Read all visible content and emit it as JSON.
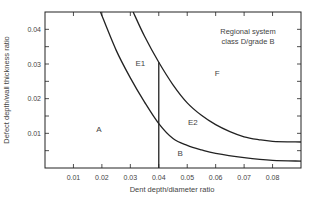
{
  "chart_data": {
    "type": "line",
    "title_lines": [
      "Regional system",
      "class D/grade B"
    ],
    "xlabel": "Dent depth/diameter ratio",
    "ylabel": "Defect depth/wall thickness ratio",
    "xlim": [
      0,
      0.09
    ],
    "ylim": [
      0,
      0.045
    ],
    "x_ticks": [
      0.01,
      0.02,
      0.03,
      0.04,
      0.05,
      0.06,
      0.07,
      0.08
    ],
    "x_tick_labels": [
      "0.01",
      "0.02",
      "0.03",
      "0.04",
      "0.05",
      "0.06",
      "0.07",
      "0.08"
    ],
    "y_ticks": [
      0.01,
      0.02,
      0.03,
      0.04
    ],
    "y_tick_labels": [
      "0.01",
      "0.02",
      "0.03",
      "0.04"
    ],
    "grid": false,
    "series": [
      {
        "name": "Lower boundary curve",
        "x": [
          0.0195,
          0.025,
          0.03,
          0.035,
          0.04,
          0.045,
          0.05,
          0.055,
          0.06,
          0.07,
          0.08,
          0.09
        ],
        "y": [
          0.045,
          0.034,
          0.026,
          0.019,
          0.0128,
          0.0085,
          0.0065,
          0.0052,
          0.0042,
          0.003,
          0.0022,
          0.002
        ]
      },
      {
        "name": "Upper boundary curve",
        "x": [
          0.031,
          0.035,
          0.04,
          0.045,
          0.05,
          0.055,
          0.06,
          0.065,
          0.07,
          0.075,
          0.08,
          0.09
        ],
        "y": [
          0.045,
          0.038,
          0.0305,
          0.024,
          0.0188,
          0.0152,
          0.0125,
          0.0105,
          0.009,
          0.0082,
          0.0077,
          0.0075
        ]
      },
      {
        "name": "Vertical limit at dent ratio 0.04",
        "x": [
          0.04,
          0.04
        ],
        "y": [
          0.0,
          0.0305
        ]
      }
    ],
    "annotations": [
      {
        "text": "A",
        "x": 0.019,
        "y": 0.0105
      },
      {
        "text": "E1",
        "x": 0.0335,
        "y": 0.0295
      },
      {
        "text": "E2",
        "x": 0.052,
        "y": 0.0125
      },
      {
        "text": "B",
        "x": 0.0475,
        "y": 0.0035
      },
      {
        "text": "F",
        "x": 0.0605,
        "y": 0.0265
      }
    ]
  }
}
